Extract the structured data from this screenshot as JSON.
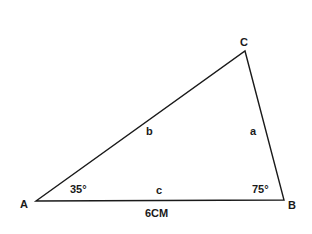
{
  "diagram": {
    "type": "triangle",
    "vertices": {
      "A": {
        "label": "A"
      },
      "B": {
        "label": "B"
      },
      "C": {
        "label": "C"
      }
    },
    "sides": {
      "a": {
        "label": "a",
        "between": [
          "B",
          "C"
        ]
      },
      "b": {
        "label": "b",
        "between": [
          "A",
          "C"
        ]
      },
      "c": {
        "label": "c",
        "between": [
          "A",
          "B"
        ],
        "length": "6CM"
      }
    },
    "angles": {
      "A": "35°",
      "B": "75°"
    },
    "line_color": "#1a1a1a"
  }
}
